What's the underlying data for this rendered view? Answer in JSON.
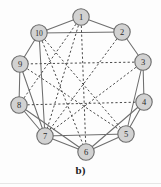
{
  "figure": {
    "caption": "b)",
    "title": "",
    "node_radius": 8.2,
    "colors": {
      "node_fill": "#d2d2d2",
      "node_stroke": "#6b6b6b",
      "solid_edge": "#6e6e6e",
      "dashed_edge": "#4a4a4a",
      "background": "#fdfdfd",
      "label_text": "#2a2a2a"
    },
    "nodes": [
      {
        "id": "1",
        "label": "1",
        "x": 81,
        "y": 17
      },
      {
        "id": "2",
        "label": "2",
        "x": 122,
        "y": 32
      },
      {
        "id": "3",
        "label": "3",
        "x": 143,
        "y": 62
      },
      {
        "id": "4",
        "label": "4",
        "x": 144,
        "y": 102
      },
      {
        "id": "5",
        "label": "5",
        "x": 126,
        "y": 134
      },
      {
        "id": "6",
        "label": "6",
        "x": 86,
        "y": 152
      },
      {
        "id": "7",
        "label": "7",
        "x": 45,
        "y": 136
      },
      {
        "id": "8",
        "label": "8",
        "x": 19,
        "y": 105
      },
      {
        "id": "9",
        "label": "9",
        "x": 20,
        "y": 64
      },
      {
        "id": "10",
        "label": "10",
        "x": 39,
        "y": 33
      }
    ],
    "solid_edges": [
      [
        "1",
        "2"
      ],
      [
        "1",
        "10"
      ],
      [
        "2",
        "3"
      ],
      [
        "3",
        "4"
      ],
      [
        "4",
        "5"
      ],
      [
        "5",
        "6"
      ],
      [
        "6",
        "7"
      ],
      [
        "7",
        "8"
      ],
      [
        "8",
        "9"
      ],
      [
        "9",
        "10"
      ],
      [
        "10",
        "2"
      ],
      [
        "10",
        "7"
      ],
      [
        "7",
        "5"
      ],
      [
        "3",
        "5"
      ],
      [
        "8",
        "6"
      ],
      [
        "9",
        "7"
      ],
      [
        "4",
        "6"
      ]
    ],
    "dashed_edges": [
      [
        "1",
        "7"
      ],
      [
        "1",
        "6"
      ],
      [
        "1",
        "8"
      ],
      [
        "2",
        "7"
      ],
      [
        "3",
        "9"
      ],
      [
        "3",
        "7"
      ],
      [
        "4",
        "8"
      ],
      [
        "10",
        "6"
      ],
      [
        "10",
        "5"
      ],
      [
        "9",
        "5"
      ]
    ]
  }
}
